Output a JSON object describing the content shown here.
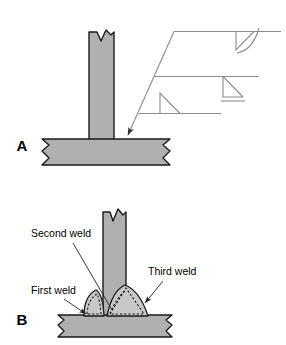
{
  "figure": {
    "background_color": "#ffffff",
    "metal_fill_color": "#b0b0b0",
    "weld_fill_color": "#c8c8c8",
    "outline_color": "#1a1a1a",
    "symbol_line_color": "#8c8c8c",
    "leader_color": "#444444"
  },
  "panels": [
    {
      "id": "A",
      "label": "A",
      "description": "Tee joint with welding symbol callout showing three fillet weld symbols",
      "label_position": {
        "x": 22,
        "y": 151
      }
    },
    {
      "id": "B",
      "label": "B",
      "description": "Tee joint cross-section showing three weld passes in sequence",
      "label_position": {
        "x": 22,
        "y": 325
      }
    }
  ],
  "panel_a": {
    "vertical_plate": {
      "name": "vertical-plate",
      "x": 89,
      "y": 30,
      "width": 25,
      "height": 110,
      "break_mark": "v-notch-top"
    },
    "horizontal_plate": {
      "name": "horizontal-plate",
      "x": 42,
      "y": 139,
      "width": 133,
      "height": 26,
      "break_mark": "zigzag-both-ends"
    },
    "arrow": {
      "name": "leader-arrow",
      "from": {
        "x": 175,
        "y": 31
      },
      "to": {
        "x": 127,
        "y": 137
      },
      "points_to": "weld-joint-root"
    },
    "welding_symbol": {
      "reference_lines": [
        {
          "id": "top",
          "x1": 175,
          "y1": 31,
          "x2": 280,
          "y2": 31,
          "weld_symbol": "fillet-below-line",
          "contour": "convex-arc"
        },
        {
          "id": "middle",
          "x1": 155,
          "y1": 76,
          "x2": 258,
          "y2": 76,
          "weld_symbol": "fillet-below-line",
          "contour": "flush-flat-bar"
        },
        {
          "id": "bottom",
          "x1": 140,
          "y1": 113,
          "x2": 220,
          "y2": 113,
          "weld_symbol": "fillet-above-line",
          "contour": "none"
        }
      ]
    }
  },
  "panel_b": {
    "vertical_plate": {
      "name": "vertical-plate",
      "x": 102,
      "y": 212,
      "width": 24,
      "height": 105,
      "break_mark": "v-notch-top"
    },
    "horizontal_plate": {
      "name": "horizontal-plate",
      "x": 58,
      "y": 315,
      "width": 116,
      "height": 22,
      "break_mark": "zigzag-both-ends"
    },
    "welds": [
      {
        "id": "first",
        "label": "First weld",
        "side": "left",
        "pass": 1
      },
      {
        "id": "second",
        "label": "Second weld",
        "side": "root",
        "pass": 2
      },
      {
        "id": "third",
        "label": "Third weld",
        "side": "right",
        "pass": 3
      }
    ],
    "callouts": [
      {
        "name": "callout-second-weld",
        "label": "Second weld",
        "text_x": 31,
        "text_y": 237,
        "leader_from": {
          "x": 72,
          "y": 243
        },
        "leader_to": {
          "x": 113,
          "y": 312
        }
      },
      {
        "name": "callout-first-weld",
        "label": "First weld",
        "text_x": 31,
        "text_y": 294,
        "leader_from": {
          "x": 65,
          "y": 299
        },
        "leader_to": {
          "x": 93,
          "y": 317
        }
      },
      {
        "name": "callout-third-weld",
        "label": "Third weld",
        "text_x": 148,
        "text_y": 275,
        "leader_from": {
          "x": 162,
          "y": 281
        },
        "leader_to": {
          "x": 143,
          "y": 305
        }
      }
    ]
  }
}
